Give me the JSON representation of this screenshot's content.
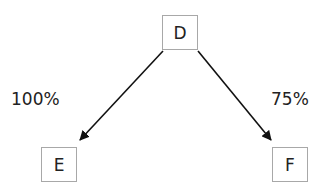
{
  "diagram": {
    "type": "tree",
    "nodes": [
      {
        "id": "D",
        "label": "D"
      },
      {
        "id": "E",
        "label": "E"
      },
      {
        "id": "F",
        "label": "F"
      }
    ],
    "edges": [
      {
        "from": "D",
        "to": "E",
        "label": "100%"
      },
      {
        "from": "D",
        "to": "F",
        "label": "75%"
      }
    ],
    "colors": {
      "node_border": "#a8a8a8",
      "arrow": "#111111",
      "text": "#222222"
    }
  }
}
